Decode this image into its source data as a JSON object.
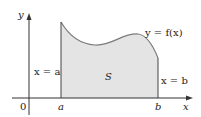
{
  "diagram": {
    "axes": {
      "x_label": "x",
      "y_label": "y",
      "origin_label": "0"
    },
    "points": {
      "a": "a",
      "b": "b"
    },
    "curve_label": "y = f(x)",
    "left_boundary_label": "x = a",
    "right_boundary_label": "x = b",
    "region_label": "S",
    "colors": {
      "region_fill": "#e4e4e4",
      "curve": "#7a7a7a",
      "axis": "#333333",
      "boundary": "#444444"
    }
  }
}
